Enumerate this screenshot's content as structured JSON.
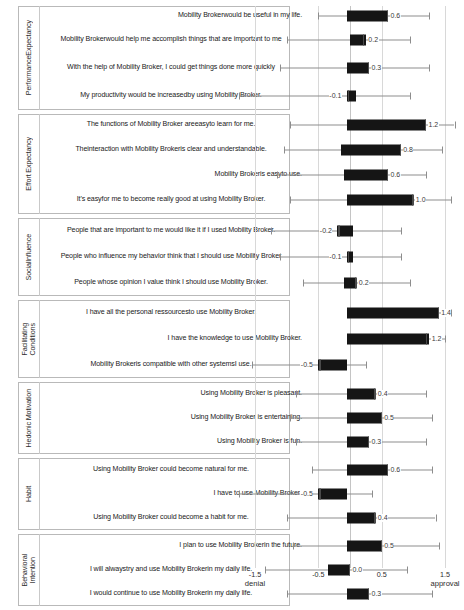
{
  "chart_data": {
    "type": "boxplot",
    "title": "",
    "xlabel": "",
    "ylabel": "",
    "xlim": [
      -1.8,
      1.8
    ],
    "grid": true,
    "grid_values": [
      -1.5,
      -0.5,
      0.5,
      1.5
    ],
    "axis": {
      "ticks": [
        {
          "value": -1.5,
          "label": "-1.5"
        },
        {
          "value": -0.5,
          "label": "-0.5"
        },
        {
          "value": 0.5,
          "label": "0.5"
        },
        {
          "value": 1.5,
          "label": "1.5"
        }
      ],
      "anchors": [
        {
          "value": -1.5,
          "label": "denial"
        },
        {
          "value": 1.5,
          "label": "approval"
        }
      ]
    },
    "groups": [
      {
        "name": "Performance Expectancy",
        "name_display": "PerformanceExpectancy",
        "items": [
          {
            "label": "Mobility  Brokerwould be useful in my life.",
            "median": 0.6,
            "median_label": "0.6",
            "q1": -0.05,
            "q3": 0.6,
            "low": -0.5,
            "high": 1.25
          },
          {
            "label": "Mobility  Brokerwould help me accomplish things that  are important  to me",
            "median": 0.2,
            "median_label": "0.2",
            "q1": 0.0,
            "q3": 0.25,
            "low": -1.0,
            "high": 0.95
          },
          {
            "label": "With the help of Mobility  Broker, I could get things done more quickly",
            "median": 0.3,
            "median_label": "0.3",
            "q1": -0.05,
            "q3": 0.3,
            "low": -1.1,
            "high": 1.25
          },
          {
            "label": "My productivity  would be increasedby using Mobility Broker.",
            "median": -0.1,
            "median_label": "-0.1",
            "q1": -0.05,
            "q3": 0.1,
            "low": -1.75,
            "high": 0.95
          }
        ]
      },
      {
        "name": "Effort Expectancy",
        "name_display": "Effort Expectancy",
        "items": [
          {
            "label": "The functions  of Mobility  Broker areeasyto learn for me.",
            "median": 1.2,
            "median_label": "1.2",
            "q1": -0.05,
            "q3": 1.2,
            "low": -0.95,
            "high": 1.65
          },
          {
            "label": "Theinteraction with  Mobility  Brokeris clear and understandable.",
            "median": 0.8,
            "median_label": "0.8",
            "q1": -0.15,
            "q3": 0.8,
            "low": -1.05,
            "high": 1.45
          },
          {
            "label": "Mobility  Brokeris easyto use.",
            "median": 0.6,
            "median_label": "0.6",
            "q1": -0.1,
            "q3": 0.6,
            "low": -1.15,
            "high": 1.2
          },
          {
            "label": "It's easyfor me to become really good at using Mobility Broker.",
            "median": 1.0,
            "median_label": "1.0",
            "q1": -0.05,
            "q3": 1.0,
            "low": -0.95,
            "high": 1.6
          }
        ]
      },
      {
        "name": "Social Influence",
        "name_display": "SocialInfluence",
        "items": [
          {
            "label": "People that are important  to me would like it if I used Mobility  Broker.",
            "median": -0.2,
            "median_label": "-0.2",
            "q1": -0.2,
            "q3": 0.05,
            "low": -1.25,
            "high": 0.8
          },
          {
            "label": "People who influence my behavior think that  I should use Mobility  Broker",
            "median": -0.1,
            "median_label": "-0.1",
            "q1": -0.05,
            "q3": 0.05,
            "low": -1.1,
            "high": 0.8
          },
          {
            "label": "People whose opinion  I value think I should use Mobility Broker.",
            "median": 0.2,
            "median_label": "0.2",
            "q1": -0.1,
            "q3": 0.1,
            "low": -0.75,
            "high": 0.95
          }
        ]
      },
      {
        "name": "Facilitating Conditions",
        "name_display": "Facilitating\nConditions",
        "items": [
          {
            "label": "I have all the personal ressourcesto use Mobility  Broker.",
            "median": 1.4,
            "median_label": "1.4",
            "q1": -0.05,
            "q3": 1.4,
            "low": -0.05,
            "high": 1.6
          },
          {
            "label": "I have the knowledge to use Mobility  Broker.",
            "median": 1.2,
            "median_label": "1.2",
            "q1": -0.05,
            "q3": 1.25,
            "low": -0.05,
            "high": 1.5
          },
          {
            "label": "Mobility  Brokeris compatible with other systemsI use.",
            "median": -0.5,
            "median_label": "-0.5",
            "q1": -0.5,
            "q3": -0.05,
            "low": -1.55,
            "high": 0.25
          }
        ]
      },
      {
        "name": "Hedonic Motivation",
        "name_display": "Hedonic Motivation",
        "items": [
          {
            "label": "Using Mobility  Broker is pleasant.",
            "median": 0.4,
            "median_label": "0.4",
            "q1": -0.05,
            "q3": 0.4,
            "low": -0.85,
            "high": 1.2
          },
          {
            "label": "Using Mobility  Broker is entertaining.",
            "median": 0.5,
            "median_label": "0.5",
            "q1": -0.05,
            "q3": 0.5,
            "low": -0.95,
            "high": 1.3
          },
          {
            "label": "Using Mobility  Broker is fun.",
            "median": 0.3,
            "median_label": "0.3",
            "q1": -0.05,
            "q3": 0.3,
            "low": -0.85,
            "high": 1.2
          }
        ]
      },
      {
        "name": "Habit",
        "name_display": "Habit",
        "items": [
          {
            "label": "Using Mobility  Broker could become natural for me.",
            "median": 0.6,
            "median_label": "0.6",
            "q1": -0.05,
            "q3": 0.6,
            "low": -0.6,
            "high": 1.3
          },
          {
            "label": "I have to use Mobility  Broker!",
            "median": -0.5,
            "median_label": "-0.5",
            "q1": -0.5,
            "q3": -0.05,
            "low": -1.75,
            "high": 0.35
          },
          {
            "label": "Using Mobility  Broker could become a habit for  me.",
            "median": 0.4,
            "median_label": "0.4",
            "q1": -0.05,
            "q3": 0.4,
            "low": -1.0,
            "high": 1.35
          }
        ]
      },
      {
        "name": "Behavioral Intention",
        "name_display": "Behavioral\nIntention",
        "items": [
          {
            "label": "I plan to use Mobility  Brokerin the future.",
            "median": 0.5,
            "median_label": "0.5",
            "q1": -0.05,
            "q3": 0.5,
            "low": -0.9,
            "high": 1.4
          },
          {
            "label": "I will  alwaystry and use Mobility  Brokerin my daily life.",
            "median": 0.0,
            "median_label": "0.0",
            "q1": -0.35,
            "q3": 0.0,
            "low": -1.35,
            "high": 0.9
          },
          {
            "label": "I would  continue to use Mobility  Brokerin my daily life.",
            "median": 0.3,
            "median_label": "0.3",
            "q1": -0.05,
            "q3": 0.3,
            "low": -1.0,
            "high": 1.3
          }
        ]
      }
    ]
  }
}
